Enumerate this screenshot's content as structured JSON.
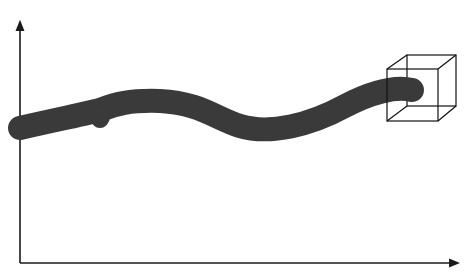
{
  "diagram": {
    "colors": {
      "background": "#ffffff",
      "axis": "#1a1a1a",
      "tube": "#3a3a3a",
      "cube": "#111111"
    },
    "axes": {
      "origin": [
        20,
        263
      ],
      "y_end": [
        20,
        20
      ],
      "x_end": [
        460,
        263
      ]
    },
    "tube": {
      "width": 24
    },
    "cube": {
      "front": [
        387,
        69,
        51,
        52
      ],
      "back": [
        407,
        55,
        49,
        51
      ]
    }
  }
}
